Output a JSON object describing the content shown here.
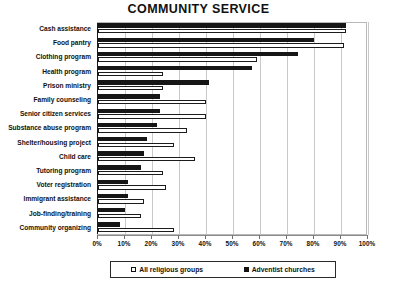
{
  "chart_data": {
    "type": "bar",
    "orientation": "horizontal",
    "title": "COMMUNITY SERVICE",
    "xlabel": "",
    "ylabel": "",
    "xlim": [
      0,
      100
    ],
    "xtick_labels": [
      "0%",
      "10%",
      "20%",
      "30%",
      "40%",
      "50%",
      "60%",
      "70%",
      "80%",
      "90%",
      "100%"
    ],
    "xticks": [
      0,
      10,
      20,
      30,
      40,
      50,
      60,
      70,
      80,
      90,
      100
    ],
    "grid": true,
    "legend_position": "bottom",
    "categories": [
      "Cash assistance",
      "Food pantry",
      "Clothing program",
      "Health program",
      "Prison ministry",
      "Family counseling",
      "Senior citizen services",
      "Substance abuse program",
      "Shelter/housing project",
      "Child care",
      "Tutoring program",
      "Voter registration",
      "Immigrant assistance",
      "Job-finding/training",
      "Community organizing"
    ],
    "series": [
      {
        "name": "All religious groups",
        "style": "open",
        "color": "#ffffff",
        "values": [
          92,
          91,
          59,
          24,
          24,
          40,
          40,
          33,
          28,
          36,
          24,
          25,
          17,
          16,
          28
        ]
      },
      {
        "name": "Adventist churches",
        "style": "filled",
        "color": "#161616",
        "values": [
          92,
          80,
          74,
          57,
          41,
          23,
          23,
          22,
          18,
          17,
          16,
          11,
          11,
          10,
          8
        ]
      }
    ]
  },
  "legend": {
    "items": [
      {
        "label": "All religious groups",
        "icon": "open-square-swatch"
      },
      {
        "label": "Adventist churches",
        "icon": "filled-square-swatch"
      }
    ]
  }
}
